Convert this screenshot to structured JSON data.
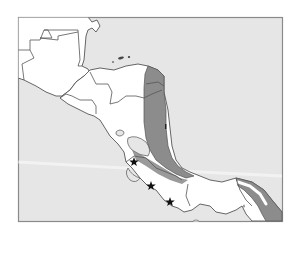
{
  "map": {
    "type": "regional-map",
    "region_depicted": "Central America",
    "colors": {
      "background": "#ffffff",
      "sea": "#e6e6e6",
      "land": "#ffffff",
      "shaded_region": "#8c8c8c",
      "border": "#555555",
      "frame": "#8a8a8a",
      "marker": "#111111"
    },
    "markers": [
      {
        "icon": "star-icon",
        "x": 134,
        "y": 162
      },
      {
        "icon": "star-icon",
        "x": 151,
        "y": 186
      },
      {
        "icon": "star-icon",
        "x": 170,
        "y": 202
      }
    ],
    "legend": null,
    "labels": []
  }
}
